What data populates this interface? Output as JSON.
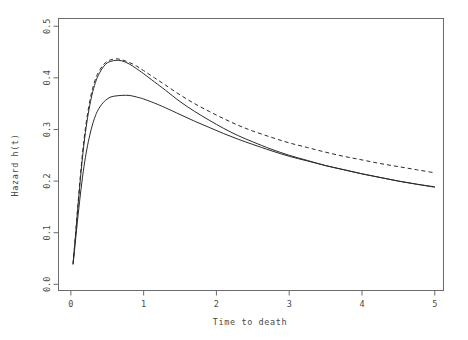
{
  "chart_data": {
    "type": "line",
    "title": "",
    "xlabel": "Time to death",
    "ylabel": "Hazard h(t)",
    "xlim": [
      -0.17,
      5.12
    ],
    "ylim": [
      -0.012,
      0.515
    ],
    "xticks": [
      0,
      1,
      2,
      3,
      4,
      5
    ],
    "xticklabels": [
      "0",
      "1",
      "2",
      "3",
      "4",
      "5"
    ],
    "yticks": [
      0.0,
      0.1,
      0.2,
      0.3,
      0.4,
      0.5
    ],
    "yticklabels": [
      "0.0",
      "0.1",
      "0.2",
      "0.3",
      "0.4",
      "0.5"
    ],
    "grid": false,
    "legend": "none",
    "box": true,
    "series": [
      {
        "name": "curve-dashed-upper",
        "linestyle": "dashed",
        "color": "#2a2a2a",
        "peak": {
          "x": 0.62,
          "y": 0.437
        },
        "x": [
          0.03,
          0.06,
          0.1,
          0.14,
          0.18,
          0.22,
          0.26,
          0.3,
          0.35,
          0.4,
          0.45,
          0.5,
          0.55,
          0.62,
          0.7,
          0.8,
          0.9,
          1.0,
          1.15,
          1.3,
          1.5,
          1.7,
          1.9,
          2.1,
          2.3,
          2.5,
          2.75,
          3.0,
          3.25,
          3.5,
          3.75,
          4.0,
          4.25,
          4.5,
          4.75,
          5.0
        ],
        "y": [
          0.04,
          0.09,
          0.16,
          0.225,
          0.28,
          0.322,
          0.355,
          0.38,
          0.402,
          0.416,
          0.426,
          0.432,
          0.435,
          0.437,
          0.435,
          0.43,
          0.423,
          0.414,
          0.4,
          0.386,
          0.367,
          0.35,
          0.335,
          0.321,
          0.308,
          0.297,
          0.285,
          0.274,
          0.265,
          0.256,
          0.248,
          0.241,
          0.234,
          0.228,
          0.222,
          0.216
        ]
      },
      {
        "name": "curve-solid-upper",
        "linestyle": "solid",
        "color": "#2a2a2a",
        "peak": {
          "x": 0.67,
          "y": 0.434
        },
        "x": [
          0.03,
          0.06,
          0.1,
          0.14,
          0.18,
          0.22,
          0.26,
          0.3,
          0.35,
          0.4,
          0.45,
          0.5,
          0.55,
          0.62,
          0.7,
          0.8,
          0.9,
          1.0,
          1.15,
          1.3,
          1.5,
          1.7,
          1.9,
          2.1,
          2.3,
          2.5,
          2.75,
          3.0,
          3.25,
          3.5,
          3.75,
          4.0,
          4.25,
          4.5,
          4.75,
          5.0
        ],
        "y": [
          0.04,
          0.088,
          0.155,
          0.218,
          0.272,
          0.314,
          0.347,
          0.373,
          0.396,
          0.411,
          0.422,
          0.429,
          0.432,
          0.434,
          0.433,
          0.427,
          0.418,
          0.408,
          0.392,
          0.376,
          0.354,
          0.335,
          0.318,
          0.302,
          0.288,
          0.276,
          0.262,
          0.25,
          0.24,
          0.23,
          0.222,
          0.214,
          0.207,
          0.2,
          0.194,
          0.189
        ]
      },
      {
        "name": "curve-solid-lower",
        "linestyle": "solid",
        "color": "#2a2a2a",
        "peak": {
          "x": 0.8,
          "y": 0.366
        },
        "x": [
          0.03,
          0.06,
          0.1,
          0.14,
          0.18,
          0.22,
          0.26,
          0.3,
          0.35,
          0.4,
          0.45,
          0.5,
          0.55,
          0.62,
          0.7,
          0.8,
          0.9,
          1.0,
          1.15,
          1.3,
          1.5,
          1.7,
          1.9,
          2.1,
          2.3,
          2.5,
          2.75,
          3.0,
          3.25,
          3.5,
          3.75,
          4.0,
          4.25,
          4.5,
          4.75,
          5.0
        ],
        "y": [
          0.038,
          0.08,
          0.135,
          0.185,
          0.228,
          0.262,
          0.289,
          0.311,
          0.331,
          0.344,
          0.353,
          0.359,
          0.363,
          0.365,
          0.366,
          0.366,
          0.363,
          0.359,
          0.351,
          0.342,
          0.329,
          0.316,
          0.304,
          0.292,
          0.281,
          0.271,
          0.259,
          0.248,
          0.239,
          0.23,
          0.222,
          0.214,
          0.207,
          0.2,
          0.194,
          0.188
        ]
      }
    ]
  },
  "axes": {
    "x_title": "Time to death",
    "y_title": "Hazard h(t)"
  },
  "colors": {
    "frame": "#6b6b6b",
    "line": "#2a2a2a",
    "text": "#4a4a4a",
    "background": "#ffffff"
  }
}
